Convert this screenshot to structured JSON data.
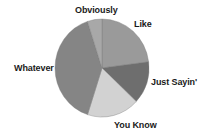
{
  "chart_data": {
    "type": "pie",
    "title": "",
    "start_angle_deg": 0,
    "direction": "clockwise",
    "categories": [
      "Like",
      "Just Sayin'",
      "You Know",
      "Whatever",
      "Obviously"
    ],
    "values": [
      23,
      14,
      18,
      40,
      5
    ],
    "unit": "percent (estimated from slice angles)",
    "colors": [
      "#9a9a9a",
      "#6e6e6e",
      "#d2d2d2",
      "#858585",
      "#a8a8a8"
    ],
    "legend": "none (direct labels)",
    "labels_position": "outside"
  },
  "labels": {
    "like": "Like",
    "just_sayin": "Just Sayin'",
    "you_know": "You Know",
    "whatever": "Whatever",
    "obviously": "Obviously"
  }
}
